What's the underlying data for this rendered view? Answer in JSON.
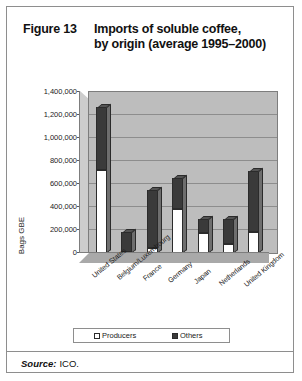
{
  "figure": {
    "number": "Figure 13",
    "title_line1": "Imports of soluble coffee,",
    "title_line2": "by origin (average 1995–2000)"
  },
  "source": {
    "label": "Source:",
    "value": "ICO."
  },
  "legend": {
    "producers": "Producers",
    "others": "Others"
  },
  "colors": {
    "producers": "#ffffff",
    "others": "#3a3a3a",
    "plot_background": "#bdbdbd",
    "gridline": "#8d8d8d",
    "frame": "#8e8e8e"
  },
  "chart_data": {
    "type": "bar",
    "title": "Imports of soluble coffee, by origin (average 1995–2000)",
    "subtype": "stacked",
    "xlabel": "",
    "ylabel": "Bags GBE",
    "ylim": [
      0,
      1400000
    ],
    "ytick_labels": [
      "1,400,000",
      "1,200,000",
      "1,000,000",
      "800,000",
      "600,000",
      "400,000",
      "200,000",
      "0"
    ],
    "ytick_values": [
      1400000,
      1200000,
      1000000,
      800000,
      600000,
      400000,
      200000,
      0
    ],
    "grid": true,
    "legend_position": "bottom",
    "categories": [
      "United States",
      "Belgium/Luxembourg",
      "France",
      "Germany",
      "Japan",
      "Netherlands",
      "United Kingdom"
    ],
    "series": [
      {
        "name": "Producers",
        "color": "#ffffff",
        "values": [
          720000,
          10000,
          40000,
          380000,
          170000,
          75000,
          180000
        ]
      },
      {
        "name": "Others",
        "color": "#3a3a3a",
        "values": [
          550000,
          175000,
          500000,
          270000,
          120000,
          215000,
          530000
        ]
      }
    ],
    "totals": [
      1270000,
      185000,
      540000,
      650000,
      290000,
      290000,
      710000
    ]
  }
}
